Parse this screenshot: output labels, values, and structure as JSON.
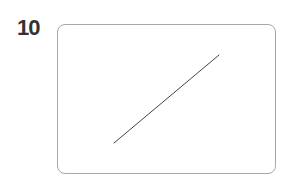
{
  "figure": {
    "number": "10",
    "frame": {
      "border_color": "#a8a8a8",
      "x": 57,
      "y": 24,
      "width": 219,
      "height": 150,
      "radius": 8
    },
    "line": {
      "x1": 114,
      "y1": 143,
      "x2": 219,
      "y2": 55,
      "color": "#444444",
      "stroke_width": 1
    }
  }
}
